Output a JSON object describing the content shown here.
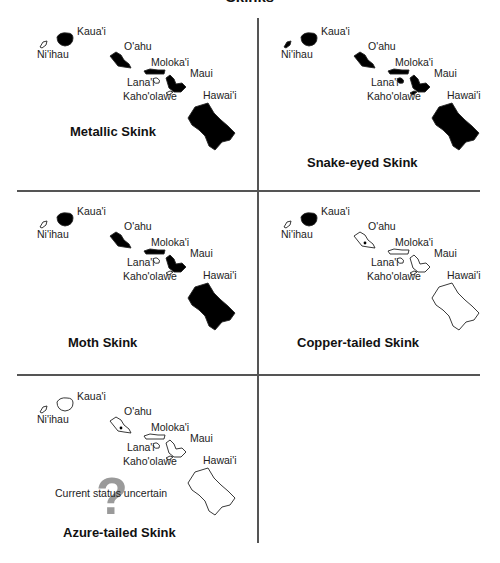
{
  "figure": {
    "title": "Skinks"
  },
  "island_labels": {
    "kauai": "Kaua'i",
    "niihau": "Ni'ihau",
    "oahu": "O'ahu",
    "molokai": "Moloka'i",
    "lanai": "Lana'i",
    "maui": "Maui",
    "kahoolawe": "Kaho'olawe",
    "hawaii": "Hawai'i"
  },
  "panels": [
    {
      "title": "Metallic Skink",
      "filled": {
        "kauai": true,
        "niihau": false,
        "oahu": true,
        "molokai": true,
        "lanai": false,
        "maui": true,
        "kahoolawe": false,
        "hawaii": true
      }
    },
    {
      "title": "Snake-eyed Skink",
      "filled": {
        "kauai": true,
        "niihau": true,
        "oahu": true,
        "molokai": true,
        "lanai": true,
        "maui": true,
        "kahoolawe": true,
        "hawaii": true
      }
    },
    {
      "title": "Moth Skink",
      "filled": {
        "kauai": true,
        "niihau": false,
        "oahu": true,
        "molokai": true,
        "lanai": false,
        "maui": true,
        "kahoolawe": false,
        "hawaii": true
      }
    },
    {
      "title": "Copper-tailed Skink",
      "filled": {
        "kauai": true,
        "niihau": false,
        "oahu": false,
        "molokai": false,
        "lanai": false,
        "maui": false,
        "kahoolawe": false,
        "hawaii": false
      },
      "oahu_dot": true
    },
    {
      "title": "Azure-tailed Skink",
      "filled": {
        "kauai": false,
        "niihau": false,
        "oahu": false,
        "molokai": false,
        "lanai": false,
        "maui": false,
        "kahoolawe": false,
        "hawaii": false
      },
      "oahu_dot": true,
      "status_note": "Current status uncertain",
      "status_icon": "?"
    }
  ],
  "colors": {
    "fill": "#000000",
    "outline": "#222222",
    "question_mark": "#9a9a9a",
    "grid": "#555555"
  }
}
